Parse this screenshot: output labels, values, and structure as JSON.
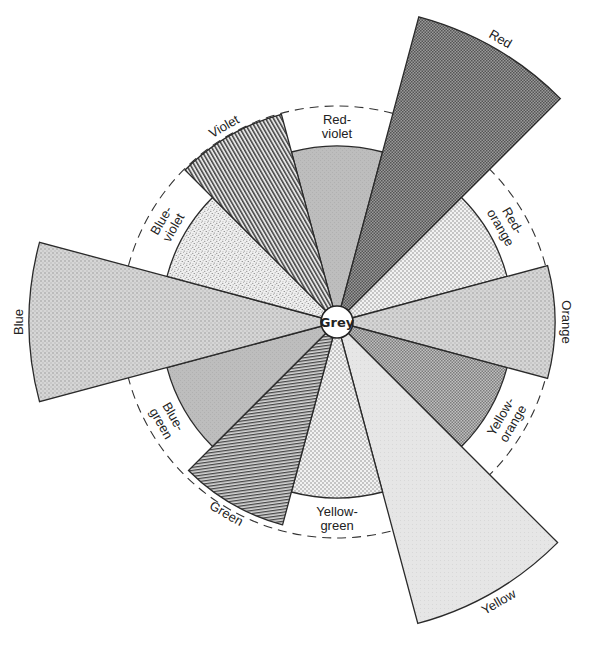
{
  "diagram": {
    "type": "color-wheel-polar-area",
    "center_label": "Grey",
    "center": {
      "x": 337,
      "y": 322
    },
    "center_radius": 16,
    "inner_radius": 176,
    "dashed_circle_radius": 216,
    "segments": [
      {
        "name": "Red-violet",
        "label_lines": [
          "Red-",
          "violet"
        ],
        "angle": 0,
        "radius": 176,
        "pattern": "grey-mid",
        "fill": "#b8b8b8",
        "label_pos": "inside-band"
      },
      {
        "name": "Red",
        "label_lines": [
          "Red"
        ],
        "angle": 30,
        "radius": 316,
        "pattern": "checker-dark",
        "fill": "#8a8a8a",
        "label_pos": "outside"
      },
      {
        "name": "Red-orange",
        "label_lines": [
          "Red-",
          "orange"
        ],
        "angle": 60,
        "radius": 176,
        "pattern": "dots-fine",
        "fill": "#e4e4e4",
        "label_pos": "inside-band"
      },
      {
        "name": "Orange",
        "label_lines": [
          "Orange"
        ],
        "angle": 90,
        "radius": 218,
        "pattern": "grid-light",
        "fill": "#cfcfcf",
        "label_pos": "outside"
      },
      {
        "name": "Yellow-orange",
        "label_lines": [
          "Yellow-",
          "orange"
        ],
        "angle": 120,
        "radius": 176,
        "pattern": "checker-mid",
        "fill": "#a8a8a8",
        "label_pos": "inside-band"
      },
      {
        "name": "Yellow",
        "label_lines": [
          "Yellow"
        ],
        "angle": 150,
        "radius": 312,
        "pattern": "flat-light",
        "fill": "#e6e6e6",
        "label_pos": "outside"
      },
      {
        "name": "Yellow-green",
        "label_lines": [
          "Yellow-",
          "green"
        ],
        "angle": 180,
        "radius": 176,
        "pattern": "dots-fine",
        "fill": "#e8e8e8",
        "label_pos": "inside-band"
      },
      {
        "name": "Green",
        "label_lines": [
          "Green"
        ],
        "angle": 210,
        "radius": 210,
        "pattern": "hlines",
        "fill": "#9c9c9c",
        "label_pos": "outside"
      },
      {
        "name": "Blue-green",
        "label_lines": [
          "Blue-",
          "green"
        ],
        "angle": 240,
        "radius": 176,
        "pattern": "grey-mid",
        "fill": "#c2c2c2",
        "label_pos": "inside-band"
      },
      {
        "name": "Blue",
        "label_lines": [
          "Blue"
        ],
        "angle": 270,
        "radius": 308,
        "pattern": "grid-light",
        "fill": "#c6c6c6",
        "label_pos": "outside"
      },
      {
        "name": "Blue-violet",
        "label_lines": [
          "Blue-",
          "violet"
        ],
        "angle": 300,
        "radius": 176,
        "pattern": "stipple",
        "fill": "#e0e0e0",
        "label_pos": "inside-band"
      },
      {
        "name": "Violet",
        "label_lines": [
          "Violet"
        ],
        "angle": 330,
        "radius": 215,
        "pattern": "diag-lines",
        "fill": "#a0a0a0",
        "label_pos": "outside"
      }
    ]
  }
}
